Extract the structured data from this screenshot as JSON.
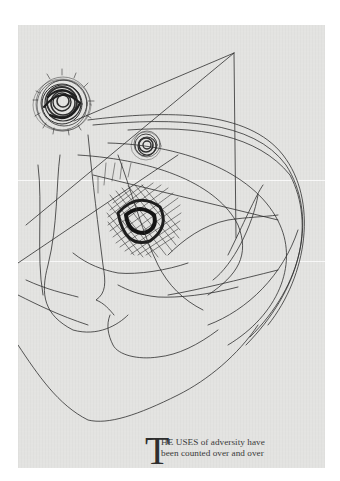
{
  "page": {
    "background_color": "#e3e3e1",
    "ink_color": "#2a2a2a"
  },
  "artwork": {
    "description": "abstract line drawing of a face in profile with scribbled circles and a crosshatched shadow",
    "elements": [
      "large-scribble-circle",
      "small-scribble-circle",
      "crosshatch-shadow",
      "triangle-lines",
      "profile-contour-lines",
      "hair-curves"
    ]
  },
  "caption": {
    "drop_cap": "T",
    "line1": "HE USES of adversity have",
    "line2": "been counted over and over"
  }
}
